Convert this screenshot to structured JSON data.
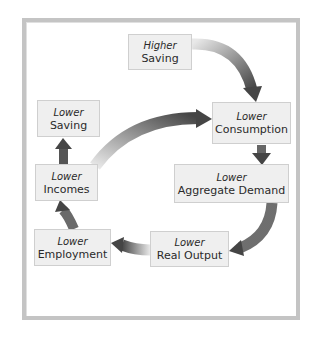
{
  "diagram": {
    "type": "cycle-flow",
    "nodes": [
      {
        "id": "higher-saving",
        "qualifier": "Higher",
        "label": "Saving"
      },
      {
        "id": "lower-consumption",
        "qualifier": "Lower",
        "label": "Consumption"
      },
      {
        "id": "lower-aggregate-demand",
        "qualifier": "Lower",
        "label": "Aggregate Demand"
      },
      {
        "id": "lower-real-output",
        "qualifier": "Lower",
        "label": "Real Output"
      },
      {
        "id": "lower-employment",
        "qualifier": "Lower",
        "label": "Employment"
      },
      {
        "id": "lower-incomes",
        "qualifier": "Lower",
        "label": "Incomes"
      },
      {
        "id": "lower-saving",
        "qualifier": "Lower",
        "label": "Saving"
      }
    ],
    "edges": [
      {
        "from": "higher-saving",
        "to": "lower-consumption"
      },
      {
        "from": "lower-consumption",
        "to": "lower-aggregate-demand"
      },
      {
        "from": "lower-aggregate-demand",
        "to": "lower-real-output"
      },
      {
        "from": "lower-real-output",
        "to": "lower-employment"
      },
      {
        "from": "lower-employment",
        "to": "lower-incomes"
      },
      {
        "from": "lower-incomes",
        "to": "lower-saving"
      },
      {
        "from": "lower-incomes",
        "to": "lower-consumption"
      }
    ],
    "colors": {
      "box_fill": "#efefef",
      "box_border": "#cfcfcf",
      "frame": "#c4c4c4",
      "arrow_dark": "#4a4a4a",
      "arrow_light": "#e6e6e6"
    }
  }
}
